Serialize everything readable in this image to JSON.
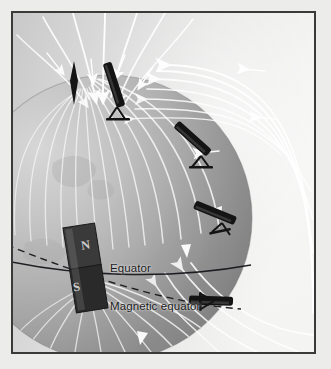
{
  "figure": {
    "kind": "scientific-illustration",
    "palette": {
      "paper": "#ececeb",
      "frame_border": "#3a3a3a",
      "sky_light": "#f2f2f1",
      "sky_mid": "#dcdcdc",
      "globe_light": "#c8c8c8",
      "globe_dark": "#8f8f8f",
      "globe_terminator": "#a8a8a8",
      "fieldline": "#ffffff",
      "magnet_body": "#2e2e2e",
      "needle": "#141414",
      "label_text": "#1c1c1c",
      "equator_line": "#15161a",
      "magnetic_equator_line": "#15161a"
    }
  },
  "labels": {
    "equator": "Equator",
    "magnetic_equator": "Magnetic equator"
  },
  "magnet": {
    "name": "bar-magnet",
    "north_label": "N",
    "south_label": "S",
    "orientation": "tilted",
    "tilt_degrees": -9
  },
  "dip_needles": [
    {
      "id": "needle-pole",
      "label": "",
      "angle_degrees": 90,
      "position": "north magnetic pole",
      "style": "diamond"
    },
    {
      "id": "needle-high-lat",
      "label": "",
      "angle_degrees": 72,
      "position": "high latitude",
      "style": "bar-on-stand"
    },
    {
      "id": "needle-mid-lat",
      "label": "",
      "angle_degrees": 40,
      "position": "mid latitude",
      "style": "bar-on-stand"
    },
    {
      "id": "needle-low-lat",
      "label": "",
      "angle_degrees": 22,
      "position": "low latitude",
      "style": "bar-on-stand"
    },
    {
      "id": "needle-equator",
      "label": "",
      "angle_degrees": 0,
      "position": "magnetic equator",
      "style": "bar-on-stand"
    }
  ],
  "field": {
    "line_count": 26,
    "arrow_count": 18,
    "arrow_direction": "into north pole / out of south pole",
    "arrow_color": "#ffffff"
  },
  "lines": {
    "equator_style": "solid",
    "magnetic_equator_style": "dashed"
  }
}
